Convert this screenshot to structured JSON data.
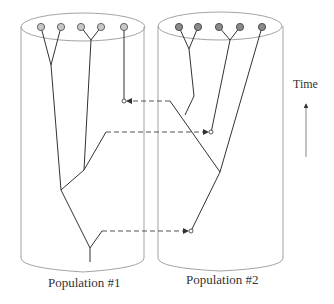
{
  "labels": {
    "population1": "Population #1",
    "population2": "Population #2",
    "time_axis": "Time"
  },
  "colors": {
    "cylinder_stroke": "#999999",
    "branch_stroke": "#333333",
    "pop1_tip_fill": "#c8c8c8",
    "pop2_tip_fill": "#8a8a8a",
    "migration_dash": "#555555"
  },
  "populations": [
    {
      "name": "Population #1",
      "tips": 5
    },
    {
      "name": "Population #2",
      "tips": 5
    }
  ],
  "migration_events": 3
}
